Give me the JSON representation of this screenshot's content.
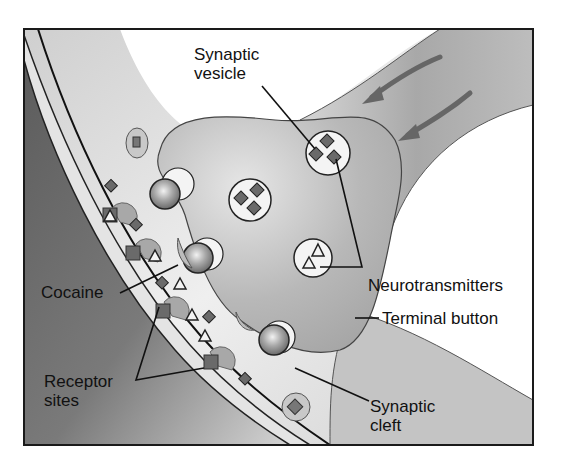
{
  "diagram": {
    "labels": {
      "synaptic_vesicle": "Synaptic\nvesicle",
      "neurotransmitters": "Neurotransmitters",
      "terminal_button": "Terminal button",
      "cocaine": "Cocaine",
      "receptor_sites": "Receptor\nsites",
      "synaptic_cleft": "Synaptic\ncleft"
    },
    "colors": {
      "frame": "#1a1a1a",
      "axon_fill": "#b4b4b4",
      "postsynaptic_fill": "#6e6e6e",
      "cleft_fill": "#e8e8e8",
      "vesicle_fill": "#f4f4f4",
      "diamond_fill": "#6a6a6a",
      "sphere_fill": "#9a9a9a"
    }
  }
}
